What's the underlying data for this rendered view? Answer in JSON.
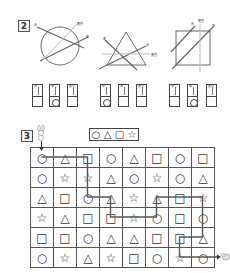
{
  "section2": {
    "number": "2",
    "figures": [
      {
        "shape": "circle",
        "labels": [
          "赤",
          "青",
          "黄色"
        ]
      },
      {
        "shape": "triangle",
        "labels": [
          "青",
          "赤",
          "黄色"
        ]
      },
      {
        "shape": "square",
        "labels": [
          "赤",
          "黄色",
          "青"
        ]
      }
    ],
    "card_groups": [
      {
        "cards": [
          {
            "label": "赤",
            "mark": ""
          },
          {
            "label": "青",
            "mark": "○"
          },
          {
            "label": "黄色",
            "mark": ""
          }
        ]
      },
      {
        "cards": [
          {
            "label": "赤",
            "mark": "○"
          },
          {
            "label": "青",
            "mark": ""
          },
          {
            "label": "黄色",
            "mark": ""
          }
        ]
      },
      {
        "cards": [
          {
            "label": "赤",
            "mark": ""
          },
          {
            "label": "青",
            "mark": "○"
          },
          {
            "label": "黄色",
            "mark": ""
          }
        ]
      }
    ]
  },
  "section3": {
    "number": "3",
    "start_icon": "rabbit-icon",
    "goal_icon": "pig-icon",
    "sequence": [
      "○",
      "△",
      "□",
      "☆"
    ],
    "grid": [
      [
        "○",
        "△",
        "□",
        "○",
        "△",
        "□",
        "○",
        "□"
      ],
      [
        "○",
        "☆",
        "☆",
        "△",
        "○",
        "☆",
        "○",
        "△"
      ],
      [
        "△",
        "□",
        "○",
        "△",
        "☆",
        "△",
        "□",
        "☆"
      ],
      [
        "☆",
        "△",
        "□",
        "□",
        "☆",
        "○",
        "□",
        "○"
      ],
      [
        "□",
        "□",
        "○",
        "△",
        "△",
        "□",
        "□",
        "△"
      ],
      [
        "○",
        "☆",
        "△",
        "☆",
        "□",
        "○",
        "☆",
        "○"
      ]
    ],
    "path": [
      [
        0,
        0
      ],
      [
        0,
        1
      ],
      [
        0,
        2
      ],
      [
        1,
        2
      ],
      [
        2,
        2
      ],
      [
        2,
        3
      ],
      [
        3,
        3
      ],
      [
        3,
        4
      ],
      [
        3,
        5
      ],
      [
        2,
        5
      ],
      [
        2,
        6
      ],
      [
        2,
        7
      ],
      [
        3,
        7
      ],
      [
        4,
        7
      ],
      [
        4,
        6
      ],
      [
        5,
        6
      ],
      [
        5,
        7
      ]
    ]
  }
}
